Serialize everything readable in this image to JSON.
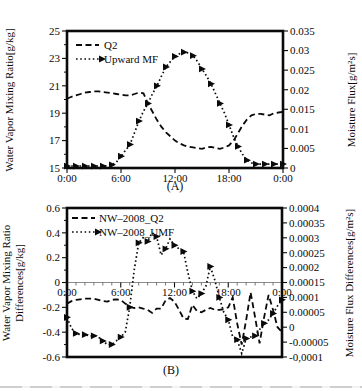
{
  "figure": {
    "panel_a_caption": "(A)",
    "panel_b_caption": "(B)"
  },
  "panel_a": {
    "caption": "(A)",
    "left_axis_label": "Water Vapor Mixing Ratio[g/kg]",
    "right_axis_label": "Moisture Flux[g/m²s]",
    "legend": [
      {
        "label": "Q2",
        "style": "dashed"
      },
      {
        "label": "Upward MF",
        "style": "dotted-triangle"
      }
    ]
  },
  "panel_b": {
    "caption": "(B)",
    "left_axis_label_line1": "Water Vapor Mixing Ratio",
    "left_axis_label_line2": "Differences[g/kg]",
    "right_axis_label": "Moisture Flux Differences[g/m²s]",
    "legend": [
      {
        "label": "NW–2008_Q2",
        "style": "dashed"
      },
      {
        "label": "NW–2008_UMF",
        "style": "dotted-triangle"
      }
    ]
  },
  "colors": {
    "ink": "#0a0a0a",
    "zero_line": "#8c8c8c"
  },
  "chart_data": [
    {
      "id": "A",
      "type": "line",
      "caption": "(A)",
      "x_axis": {
        "range_hours": [
          0,
          24
        ],
        "tick_hours": [
          0,
          6,
          12,
          18,
          24
        ],
        "tick_labels": [
          "0:00",
          "6:00",
          "12:00",
          "18:00",
          "0:00"
        ],
        "on_zero_line": false
      },
      "left_axis": {
        "label": "Water Vapor Mixing Ratio[g/kg]",
        "range": [
          15,
          25
        ],
        "ticks": [
          [
            25,
            "25"
          ],
          [
            23,
            "23"
          ],
          [
            21,
            "21"
          ],
          [
            19,
            "19"
          ],
          [
            17,
            "17"
          ],
          [
            15,
            "15"
          ]
        ],
        "minor_ticks": [
          24,
          22,
          20,
          18,
          16
        ]
      },
      "right_axis": {
        "label": "Moisture Flux[g/m²s]",
        "range": [
          0,
          0.035
        ],
        "ticks": [
          [
            0.035,
            "0.035"
          ],
          [
            0.03,
            "0.03"
          ],
          [
            0.025,
            "0.025"
          ],
          [
            0.02,
            "0.02"
          ],
          [
            0.015,
            "0.015"
          ],
          [
            0.01,
            "0.01"
          ],
          [
            0.005,
            "0.005"
          ],
          [
            0,
            "0"
          ]
        ],
        "minor_ticks": []
      },
      "series": [
        {
          "name": "Q2",
          "axis": "left",
          "style": "dashed",
          "x_step_hours": 0.5,
          "values": [
            20.05,
            20.2,
            20.3,
            20.4,
            20.5,
            20.55,
            20.6,
            20.6,
            20.55,
            20.5,
            20.45,
            20.4,
            20.35,
            20.3,
            20.3,
            20.4,
            20.5,
            20.45,
            19.7,
            19.1,
            18.5,
            18.0,
            17.6,
            17.3,
            17.0,
            16.8,
            16.65,
            16.55,
            16.5,
            16.45,
            16.4,
            16.5,
            16.55,
            16.45,
            16.4,
            16.5,
            16.65,
            17.0,
            17.55,
            18.1,
            18.55,
            18.85,
            18.95,
            18.95,
            18.9,
            18.85,
            19.0,
            19.05,
            19.1
          ]
        },
        {
          "name": "Upward MF",
          "axis": "right",
          "style": "dotted-triangle",
          "x_step_hours": 0.5,
          "marker_every": 2,
          "values": [
            0.0005,
            0.0005,
            0.0005,
            0.0005,
            0.0005,
            0.0005,
            0.0005,
            0.0005,
            0.0005,
            0.0006,
            0.0008,
            0.0015,
            0.003,
            0.0045,
            0.006,
            0.009,
            0.012,
            0.0145,
            0.0165,
            0.019,
            0.021,
            0.0235,
            0.0258,
            0.0272,
            0.0285,
            0.0292,
            0.0296,
            0.0294,
            0.0287,
            0.0272,
            0.0253,
            0.0235,
            0.0215,
            0.019,
            0.0165,
            0.014,
            0.011,
            0.008,
            0.0055,
            0.0035,
            0.002,
            0.0013,
            0.001,
            0.001,
            0.001,
            0.001,
            0.001,
            0.001,
            0.001
          ]
        }
      ]
    },
    {
      "id": "B",
      "type": "line",
      "caption": "(B)",
      "x_axis": {
        "range_hours": [
          0,
          24
        ],
        "tick_hours": [
          0,
          6,
          12,
          18,
          24
        ],
        "tick_labels": [
          "0:00",
          "6:00",
          "12:00",
          "18:00",
          "0:00"
        ],
        "on_zero_line": true
      },
      "left_axis": {
        "label": "Water Vapor Mixing Ratio Differences[g/kg]",
        "range": [
          -0.6,
          0.6
        ],
        "ticks": [
          [
            0.6,
            "0.6"
          ],
          [
            0.4,
            "0.4"
          ],
          [
            0.2,
            "0.2"
          ],
          [
            0,
            "0"
          ],
          [
            -0.2,
            "-0.2"
          ],
          [
            -0.4,
            "-0.4"
          ],
          [
            -0.6,
            "-0.6"
          ]
        ],
        "minor_ticks": [
          0.5,
          0.3,
          0.1,
          -0.1,
          -0.3,
          -0.5
        ]
      },
      "right_axis": {
        "label": "Moisture Flux Differences[g/m²s]",
        "range": [
          -0.0001,
          0.0004
        ],
        "ticks": [
          [
            0.0004,
            "0.0004"
          ],
          [
            0.00035,
            "0.00035"
          ],
          [
            0.0003,
            "0.0003"
          ],
          [
            0.00025,
            "0.00025"
          ],
          [
            0.0002,
            "0.0002"
          ],
          [
            0.00015,
            "0.00015"
          ],
          [
            0.0001,
            "0.0001"
          ],
          [
            5e-05,
            "0.00005"
          ],
          [
            0,
            "0"
          ],
          [
            -5e-05,
            "-0.00005"
          ],
          [
            -0.0001,
            "-0,0001"
          ]
        ],
        "minor_ticks": []
      },
      "series": [
        {
          "name": "NW–2008_Q2",
          "axis": "left",
          "style": "dashed",
          "x_step_hours": 0.5,
          "values": [
            -0.17,
            -0.15,
            -0.14,
            -0.135,
            -0.13,
            -0.13,
            -0.13,
            -0.14,
            -0.15,
            -0.155,
            -0.14,
            -0.135,
            -0.14,
            -0.17,
            -0.195,
            -0.205,
            -0.2,
            -0.21,
            -0.22,
            -0.245,
            -0.21,
            -0.21,
            -0.145,
            -0.125,
            -0.155,
            -0.22,
            -0.29,
            -0.295,
            -0.18,
            -0.23,
            -0.24,
            -0.22,
            -0.205,
            -0.22,
            -0.22,
            -0.215,
            -0.2,
            -0.12,
            -0.33,
            -0.5,
            -0.3,
            -0.08,
            -0.28,
            -0.49,
            -0.28,
            -0.1,
            -0.22,
            -0.36,
            -0.4
          ]
        },
        {
          "name": "NW–2008_UMF",
          "axis": "right",
          "style": "dotted-triangle",
          "x_step_hours": 0.5,
          "marker_every": 2,
          "values": [
            3.3e-05,
            -4e-06,
            -2.1e-05,
            -2.5e-05,
            -2.5e-05,
            -2.9e-05,
            -2.9e-05,
            -3.3e-05,
            -4.6e-05,
            -5.8e-05,
            -5.8e-05,
            -4.6e-05,
            -3.3e-05,
            -1.7e-05,
            6.7e-05,
            0.000192,
            0.000283,
            0.0003,
            0.000288,
            0.000317,
            0.000304,
            0.000242,
            0.000263,
            0.000296,
            0.000275,
            0.000263,
            0.000254,
            0.000183,
            0.000121,
            9.6e-05,
            0.000113,
            0.000138,
            0.000204,
            0.000158,
            0.0001,
            5e-05,
            2.5e-05,
            -3.3e-05,
            -4.2e-05,
            -8.8e-05,
            -3.8e-05,
            -3.3e-05,
            -2.9e-05,
            -8e-06,
            1.3e-05,
            2.5e-05,
            4.6e-05,
            7.1e-05,
            9.2e-05
          ]
        }
      ]
    }
  ]
}
